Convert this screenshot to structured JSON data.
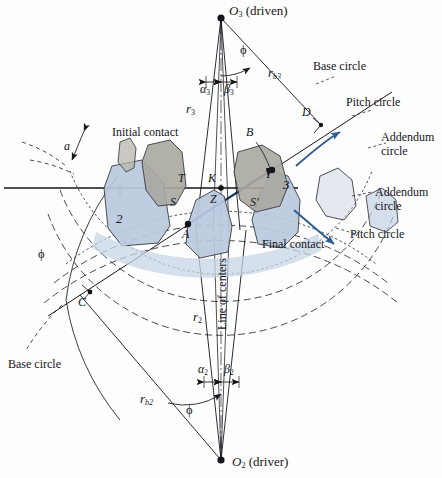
{
  "figure": {
    "type": "engineering-diagram",
    "background_color": "#fefefe",
    "ink_color": "#15151a",
    "accent_blue": "#2d5c93",
    "gear2_fill": "#b9c9dd",
    "gear3_fill": "#a9a9a1"
  },
  "centers": {
    "top": {
      "label": "O",
      "sub": "3",
      "note": "(driven)"
    },
    "bottom": {
      "label": "O",
      "sub": "2",
      "note": "(driver)"
    }
  },
  "gears": {
    "driver_number": "2",
    "driven_number": "3"
  },
  "radii": {
    "pitch_top": {
      "label": "r",
      "sub": "3"
    },
    "pitch_bottom": {
      "label": "r",
      "sub": "2"
    },
    "base_top": {
      "label": "r",
      "sub": "b3"
    },
    "base_bottom": {
      "label": "r",
      "sub": "b2"
    }
  },
  "angles": {
    "pressure_angle": "ϕ",
    "alpha3": {
      "label": "α",
      "sub": "3"
    },
    "beta3": {
      "label": "β",
      "sub": "3"
    },
    "alpha2": {
      "label": "α",
      "sub": "2"
    },
    "beta2": {
      "label": "β",
      "sub": "2"
    },
    "addendum_dim": "a"
  },
  "points": {
    "A": "A",
    "B": "B",
    "C": "C",
    "D": "D",
    "K": "K",
    "Z": "Z",
    "S": "S",
    "S_prime": "S'",
    "T": "T",
    "T_prime": "T'"
  },
  "callouts": {
    "base_circle_top": "Base circle",
    "pitch_circle_top": "Pitch circle",
    "addendum_circle_top": "Addendum\ncircle",
    "addendum_circle_bottom": "Addendum\ncircle",
    "pitch_circle_bottom": "Pitch circle",
    "base_circle_bottom": "Base circle",
    "initial_contact": "Initial contact",
    "final_contact": "Final contact",
    "line_of_centers": "Line of centers"
  },
  "callouts_split": {
    "addendum_top_line1": "Addendum",
    "addendum_top_line2": "circle",
    "addendum_bottom_line1": "Addendum",
    "addendum_bottom_line2": "circle"
  }
}
